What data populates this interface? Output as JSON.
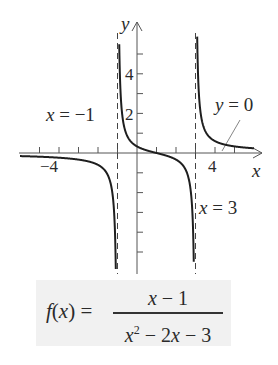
{
  "chart_data": {
    "type": "line",
    "title": "",
    "function": "f(x) = (x - 1) / (x^2 - 2x - 3)",
    "xlabel": "x",
    "ylabel": "y",
    "xlim": [
      -6,
      6.5
    ],
    "ylim": [
      -6,
      6.5
    ],
    "x_ticks": [
      -5,
      -4,
      -3,
      -2,
      -1,
      1,
      2,
      3,
      4,
      5
    ],
    "x_tick_labels": [
      {
        "value": -4,
        "label": "−4"
      },
      {
        "value": 4,
        "label": "4"
      }
    ],
    "y_ticks": [
      -5,
      -4,
      -3,
      -2,
      -1,
      1,
      2,
      3,
      4,
      5
    ],
    "y_tick_labels": [
      {
        "value": 4,
        "label": "4"
      },
      {
        "value": 2,
        "label": "2"
      }
    ],
    "grid": false,
    "legend": null,
    "vertical_asymptotes": [
      -1,
      3
    ],
    "horizontal_asymptote": 0,
    "annotations": [
      {
        "text": "x = −1",
        "target": "vertical asymptote x=-1"
      },
      {
        "text": "y = 0",
        "target": "horizontal asymptote y=0"
      },
      {
        "text": "x = 3",
        "target": "vertical asymptote x=3"
      }
    ],
    "series": [
      {
        "name": "left branch",
        "x_range": [
          -6,
          -1.05
        ],
        "sample_points": [
          [
            -6,
            -0.21
          ],
          [
            -4,
            -0.38
          ],
          [
            -3,
            -0.67
          ],
          [
            -2,
            -0.6
          ],
          [
            -1.5,
            -1.11
          ],
          [
            -1.1,
            -5.12
          ]
        ]
      },
      {
        "name": "middle branch",
        "x_range": [
          -0.95,
          2.95
        ],
        "sample_points": [
          [
            -0.9,
            4.87
          ],
          [
            -0.5,
            1.71
          ],
          [
            0,
            0.33
          ],
          [
            1,
            0
          ],
          [
            2,
            -0.33
          ],
          [
            2.5,
            -0.43
          ],
          [
            2.9,
            -4.87
          ]
        ]
      },
      {
        "name": "right branch",
        "x_range": [
          3.05,
          6.0
        ],
        "sample_points": [
          [
            3.1,
            5.12
          ],
          [
            3.5,
            1.11
          ],
          [
            4,
            0.6
          ],
          [
            5,
            0.67
          ],
          [
            6,
            0.24
          ]
        ]
      }
    ]
  },
  "labels": {
    "x_axis": "x",
    "y_axis": "y",
    "asym_left": "x = −1",
    "asym_right": "x = 3",
    "asym_horizontal": "y = 0",
    "tick_neg4": "−4",
    "tick_4": "4",
    "tick_y4": "4",
    "tick_y2": "2"
  },
  "formula": {
    "lhs": "f(x) =",
    "numerator": "x − 1",
    "den_x": "x",
    "den_exp": "2",
    "den_rest": " − 2x − 3"
  },
  "colors": {
    "curve": "#1e1e1e",
    "axis": "#555555",
    "asymptote": "#444444",
    "formula_bg": "#f1f1f1"
  }
}
